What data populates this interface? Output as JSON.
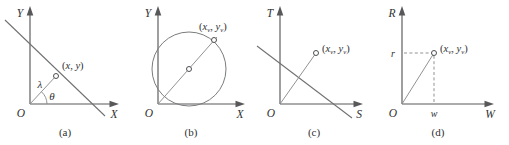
{
  "figure": {
    "panels": [
      {
        "id": "a",
        "caption": "(a)",
        "y_axis_label": "Y",
        "x_axis_label": "X",
        "origin_label": "O",
        "point_label_open": "(",
        "point_x": "x",
        "point_sep": ", ",
        "point_y": "y",
        "point_label_close": ")",
        "distance_label": "λ",
        "angle_label": "θ"
      },
      {
        "id": "b",
        "caption": "(b)",
        "y_axis_label": "Y",
        "x_axis_label": "X",
        "origin_label": "O",
        "point_label_open": "(",
        "point_x": "x",
        "point_x_sub": "v",
        "point_sep": ", ",
        "point_y": "y",
        "point_y_sub": "v",
        "point_label_close": ")"
      },
      {
        "id": "c",
        "caption": "(c)",
        "y_axis_label": "T",
        "x_axis_label": "S",
        "origin_label": "O",
        "point_label_open": "(",
        "point_x": "x",
        "point_x_sub": "v",
        "point_sep": ", ",
        "point_y": "y",
        "point_y_sub": "v",
        "point_label_close": ")"
      },
      {
        "id": "d",
        "caption": "(d)",
        "y_axis_label": "R",
        "x_axis_label": "W",
        "origin_label": "O",
        "point_label_open": "(",
        "point_x": "x",
        "point_x_sub": "v",
        "point_sep": ", ",
        "point_y": "y",
        "point_y_sub": "v",
        "point_label_close": ")",
        "r_tick_label": "r",
        "w_tick_label": "w"
      }
    ],
    "colors": {
      "axis": "#58585a",
      "line": "#6f7072",
      "thin_line": "#8b8c8e",
      "circle": "#7b7c7e",
      "point_stroke": "#4d4e50",
      "text": "#2f2f31",
      "background": "#ffffff"
    }
  }
}
